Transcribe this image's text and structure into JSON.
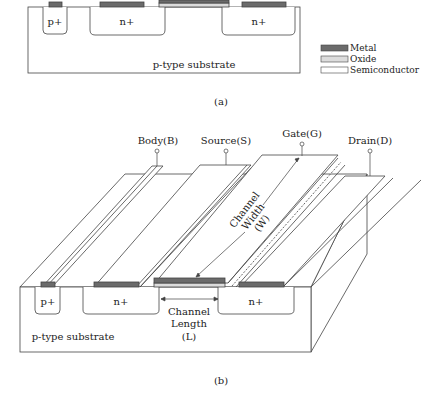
{
  "colors": {
    "metal": "#6b6b6b",
    "oxide": "#dcdcdc",
    "semiconductor": "#ffffff",
    "line": "#444444"
  },
  "figure_a": {
    "caption": "(a)",
    "regions": {
      "p_plus": "p+",
      "n_plus_source": "n+",
      "n_plus_drain": "n+",
      "substrate": "p-type substrate"
    },
    "legend": [
      {
        "key": "metal",
        "label": "Metal"
      },
      {
        "key": "oxide",
        "label": "Oxide"
      },
      {
        "key": "semiconductor",
        "label": "Semiconductor"
      }
    ]
  },
  "figure_b": {
    "caption": "(b)",
    "terminals": {
      "body": "Body(B)",
      "source": "Source(S)",
      "gate": "Gate(G)",
      "drain": "Drain(D)"
    },
    "regions": {
      "p_plus": "p+",
      "n_plus_source": "n+",
      "n_plus_drain": "n+",
      "substrate": "p-type substrate"
    },
    "channel_width": {
      "line1": "Channel",
      "line2": "Width",
      "line3": "(W)"
    },
    "channel_length": {
      "line1": "Channel",
      "line2": "Length",
      "line3": "(L)"
    }
  }
}
